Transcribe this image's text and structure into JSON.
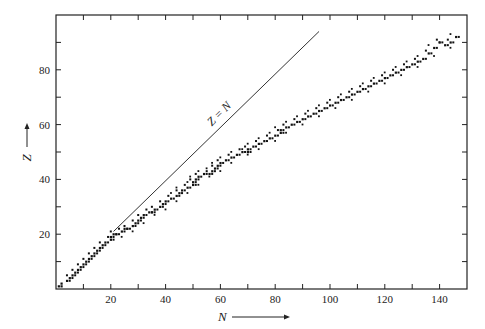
{
  "chart_data": {
    "type": "scatter",
    "title": "",
    "xlabel": "N",
    "ylabel": "Z",
    "xlim": [
      0,
      150
    ],
    "ylim": [
      0,
      100
    ],
    "x_ticks": [
      20,
      40,
      60,
      80,
      100,
      120,
      140
    ],
    "y_ticks": [
      20,
      40,
      60,
      80
    ],
    "grid": false,
    "annotation": "Z = N",
    "reference_line": {
      "label": "Z = N",
      "from": [
        21,
        21
      ],
      "to": [
        96,
        94
      ]
    },
    "series": [
      {
        "name": "stable nuclei (band)",
        "points": [
          [
            1,
            1
          ],
          [
            2,
            1
          ],
          [
            2,
            2
          ],
          [
            4,
            3
          ],
          [
            5,
            4
          ],
          [
            6,
            5
          ],
          [
            7,
            6
          ],
          [
            8,
            7
          ],
          [
            9,
            8
          ],
          [
            10,
            9
          ],
          [
            11,
            10
          ],
          [
            12,
            11
          ],
          [
            13,
            12
          ],
          [
            14,
            13
          ],
          [
            15,
            14
          ],
          [
            16,
            15
          ],
          [
            17,
            16
          ],
          [
            18,
            17
          ],
          [
            20,
            18
          ],
          [
            20,
            19
          ],
          [
            21,
            20
          ],
          [
            22,
            20
          ],
          [
            24,
            21
          ],
          [
            25,
            22
          ],
          [
            26,
            22
          ],
          [
            28,
            23
          ],
          [
            29,
            24
          ],
          [
            30,
            25
          ],
          [
            31,
            26
          ],
          [
            32,
            27
          ],
          [
            34,
            28
          ],
          [
            35,
            28
          ],
          [
            36,
            29
          ],
          [
            38,
            30
          ],
          [
            39,
            31
          ],
          [
            40,
            32
          ],
          [
            42,
            33
          ],
          [
            44,
            34
          ],
          [
            45,
            35
          ],
          [
            46,
            36
          ],
          [
            48,
            37
          ],
          [
            50,
            38
          ],
          [
            50,
            39
          ],
          [
            51,
            40
          ],
          [
            52,
            41
          ],
          [
            54,
            42
          ],
          [
            56,
            42
          ],
          [
            57,
            43
          ],
          [
            58,
            44
          ],
          [
            59,
            45
          ],
          [
            60,
            46
          ],
          [
            62,
            47
          ],
          [
            64,
            48
          ],
          [
            66,
            49
          ],
          [
            68,
            50
          ],
          [
            70,
            50
          ],
          [
            70,
            51
          ],
          [
            72,
            52
          ],
          [
            74,
            53
          ],
          [
            76,
            54
          ],
          [
            78,
            55
          ],
          [
            80,
            56
          ],
          [
            82,
            57
          ],
          [
            82,
            58
          ],
          [
            84,
            59
          ],
          [
            86,
            60
          ],
          [
            88,
            61
          ],
          [
            90,
            62
          ],
          [
            92,
            63
          ],
          [
            94,
            64
          ],
          [
            96,
            65
          ],
          [
            98,
            66
          ],
          [
            100,
            67
          ],
          [
            102,
            68
          ],
          [
            104,
            69
          ],
          [
            106,
            70
          ],
          [
            108,
            71
          ],
          [
            110,
            72
          ],
          [
            112,
            73
          ],
          [
            114,
            74
          ],
          [
            116,
            75
          ],
          [
            118,
            76
          ],
          [
            120,
            77
          ],
          [
            122,
            78
          ],
          [
            124,
            79
          ],
          [
            126,
            80
          ],
          [
            128,
            81
          ],
          [
            130,
            82
          ],
          [
            132,
            83
          ],
          [
            134,
            84
          ],
          [
            136,
            86
          ],
          [
            138,
            88
          ],
          [
            140,
            90
          ],
          [
            142,
            89
          ],
          [
            144,
            90
          ],
          [
            146,
            92
          ]
        ]
      }
    ]
  },
  "labels": {
    "x_axis": "N",
    "y_axis": "Z",
    "line": "Z = N"
  }
}
